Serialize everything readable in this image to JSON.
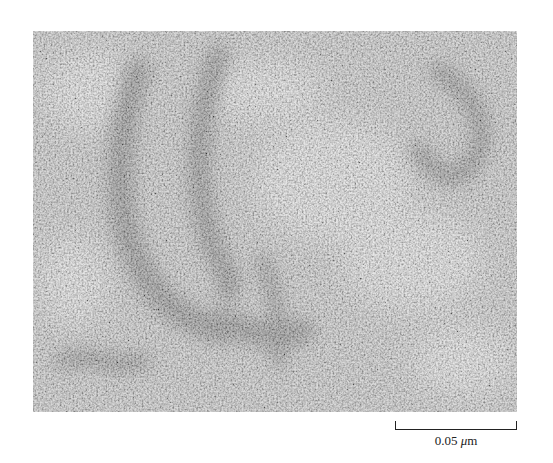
{
  "figure": {
    "type": "electron-micrograph",
    "colors": {
      "background": "#a9a9a9",
      "light_grain": "#d9d9d9",
      "dark_feature": "#5e5e5e"
    }
  },
  "scale_bar": {
    "value": "0.05",
    "unit_prefix": "μ",
    "unit_suffix": "m"
  }
}
